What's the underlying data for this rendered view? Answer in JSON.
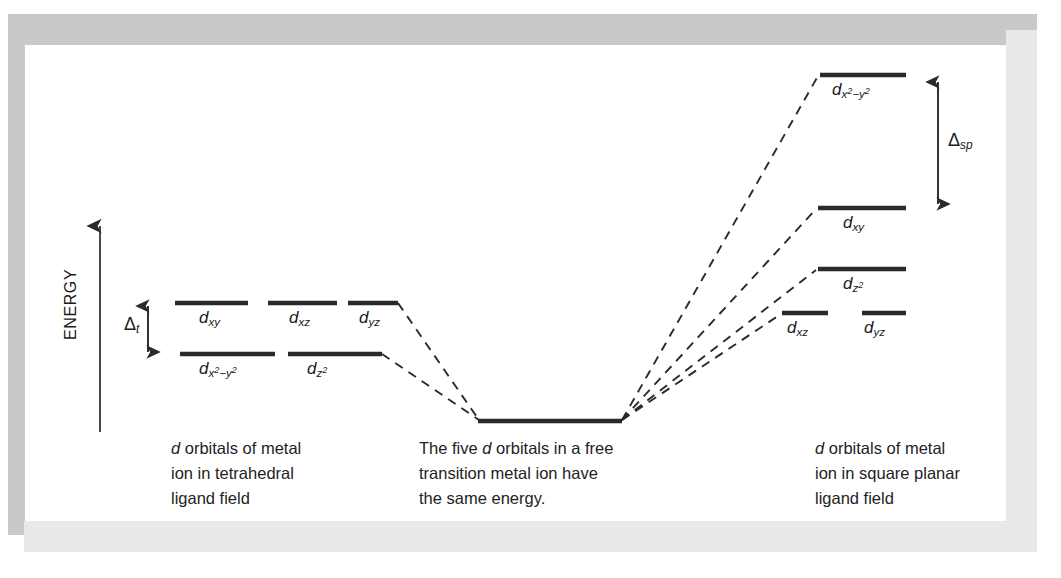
{
  "figure": {
    "kind": "crystal-field-splitting-diagram",
    "axis": {
      "label": "ENERGY",
      "direction": "up"
    },
    "frame": {
      "band_color_dark": "#c9c9c9",
      "band_color_light": "#e9e9e9",
      "plate_color": "#ffffff"
    },
    "ink_color": "#2a2a2a"
  },
  "splitting_labels": [
    {
      "id": "delta-t",
      "symbol": "Δ",
      "subscript": "t",
      "panel": "tetrahedral"
    },
    {
      "id": "delta-sp",
      "symbol": "Δ",
      "subscript": "sp",
      "panel": "square-planar"
    }
  ],
  "panels": [
    {
      "id": "tetrahedral",
      "caption_lines": [
        "d orbitals of metal",
        "ion in tetrahedral",
        "ligand field"
      ],
      "caption_italic_lead": "d",
      "levels": [
        {
          "id": "t-upper-dxy",
          "orbital_base": "d",
          "sub": "xy",
          "sub_sup": "",
          "energy_rank": "upper"
        },
        {
          "id": "t-upper-dxz",
          "orbital_base": "d",
          "sub": "xz",
          "sub_sup": "",
          "energy_rank": "upper"
        },
        {
          "id": "t-upper-dyz",
          "orbital_base": "d",
          "sub": "yz",
          "sub_sup": "",
          "energy_rank": "upper"
        },
        {
          "id": "t-lower-dx2y2",
          "orbital_base": "d",
          "sub": "x",
          "sub_sup": "2",
          "sub_tail": "−y",
          "sub_tail_sup": "2",
          "energy_rank": "lower"
        },
        {
          "id": "t-lower-dz2",
          "orbital_base": "d",
          "sub": "z",
          "sub_sup": "2",
          "energy_rank": "lower"
        }
      ]
    },
    {
      "id": "free-ion",
      "caption_lines": [
        "The five d orbitals in a free",
        "transition metal ion have",
        "the same energy."
      ],
      "levels": [
        {
          "id": "free-degenerate",
          "orbital_base": "",
          "sub": "",
          "energy_rank": "barycenter",
          "degeneracy": 5
        }
      ]
    },
    {
      "id": "square-planar",
      "caption_lines": [
        "d orbitals of metal",
        "ion in square planar",
        "ligand field"
      ],
      "caption_italic_lead": "d",
      "levels": [
        {
          "id": "sp-dx2y2",
          "orbital_base": "d",
          "sub": "x",
          "sub_sup": "2",
          "sub_tail": "−y",
          "sub_tail_sup": "2",
          "energy_rank": "1-highest"
        },
        {
          "id": "sp-dxy",
          "orbital_base": "d",
          "sub": "xy",
          "sub_sup": "",
          "energy_rank": "2"
        },
        {
          "id": "sp-dz2",
          "orbital_base": "d",
          "sub": "z",
          "sub_sup": "2",
          "energy_rank": "3"
        },
        {
          "id": "sp-dxz",
          "orbital_base": "d",
          "sub": "xz",
          "sub_sup": "",
          "energy_rank": "4-lowest"
        },
        {
          "id": "sp-dyz",
          "orbital_base": "d",
          "sub": "yz",
          "sub_sup": "",
          "energy_rank": "4-lowest"
        }
      ]
    }
  ],
  "geometry": {
    "energy_arrow": {
      "x": 100,
      "y_top": 222,
      "y_bottom": 432
    },
    "delta_t_arrow": {
      "x": 148,
      "y_top": 300,
      "y_bottom": 358
    },
    "delta_sp_arrow": {
      "x": 938,
      "y_top": 76,
      "y_bottom": 210
    },
    "tet_bars": [
      {
        "id": "t-upper-dxy",
        "x1": 175,
        "x2": 248,
        "y": 303
      },
      {
        "id": "t-upper-dxz",
        "x1": 268,
        "x2": 337,
        "y": 303
      },
      {
        "id": "t-upper-dyz",
        "x1": 348,
        "x2": 398,
        "y": 303
      },
      {
        "id": "t-lower-dx2y2",
        "x1": 180,
        "x2": 275,
        "y": 354
      },
      {
        "id": "t-lower-dz2",
        "x1": 288,
        "x2": 382,
        "y": 354
      }
    ],
    "free_bar": {
      "x1": 478,
      "x2": 622,
      "y": 421
    },
    "sp_bars": [
      {
        "id": "sp-dx2y2",
        "x1": 820,
        "x2": 906,
        "y": 75
      },
      {
        "id": "sp-dxy",
        "x1": 818,
        "x2": 906,
        "y": 208
      },
      {
        "id": "sp-dz2",
        "x1": 818,
        "x2": 906,
        "y": 269
      },
      {
        "id": "sp-dxz",
        "x1": 782,
        "x2": 828,
        "y": 313
      },
      {
        "id": "sp-dyz",
        "x1": 862,
        "x2": 906,
        "y": 313
      }
    ]
  },
  "labels_text": {
    "dxy": {
      "base": "d",
      "sub": "xy"
    },
    "dxz": {
      "base": "d",
      "sub": "xz"
    },
    "dyz": {
      "base": "d",
      "sub": "yz"
    },
    "dz2": {
      "base": "d",
      "sub": "z",
      "sup": "2"
    },
    "dx2y2": {
      "base": "d",
      "sub_a": "x",
      "sup_a": "2",
      "sub_b": "−y",
      "sup_b": "2"
    }
  }
}
